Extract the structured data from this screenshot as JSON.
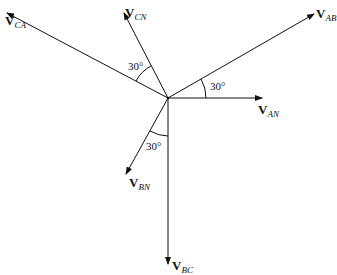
{
  "diagram": {
    "type": "phasor-diagram",
    "origin": {
      "x": 168,
      "y": 98
    },
    "phasors": [
      {
        "id": "VAB",
        "symbol": "V",
        "sub": "AB",
        "x2": 314,
        "y2": 14
      },
      {
        "id": "VAN",
        "symbol": "V",
        "sub": "AN",
        "x2": 262,
        "y2": 98
      },
      {
        "id": "VCN",
        "symbol": "V",
        "sub": "CN",
        "x2": 124,
        "y2": 13
      },
      {
        "id": "VCA",
        "symbol": "V",
        "sub": "CA",
        "x2": 7,
        "y2": 13
      },
      {
        "id": "VBN",
        "symbol": "V",
        "sub": "BN",
        "x2": 126,
        "y2": 174
      },
      {
        "id": "VBC",
        "symbol": "V",
        "sub": "BC",
        "x2": 168,
        "y2": 264
      }
    ],
    "angles": [
      {
        "label": "30°",
        "between": "VAN-VAB"
      },
      {
        "label": "30°",
        "between": "VCA-VCN"
      },
      {
        "label": "30°",
        "between": "VBN-VBC"
      }
    ]
  }
}
